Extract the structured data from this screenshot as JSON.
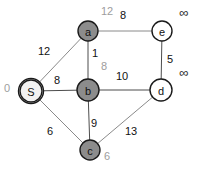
{
  "diagram": {
    "type": "weighted-undirected-graph",
    "title": "",
    "nodes": [
      {
        "id": "S",
        "label": "S",
        "cx": 31,
        "cy": 91,
        "r": 11,
        "fill": "#f2f2f2",
        "stroke": "#1a1a1a",
        "visited": false,
        "dist": "0",
        "dist_x": 7,
        "dist_y": 88,
        "dist_style": "gray"
      },
      {
        "id": "a",
        "label": "a",
        "cx": 88,
        "cy": 31,
        "r": 10,
        "fill": "#8c8c8c",
        "stroke": "#1a1a1a",
        "visited": true,
        "dist": "12",
        "dist_x": 107,
        "dist_y": 11,
        "dist_style": "gray"
      },
      {
        "id": "b",
        "label": "b",
        "cx": 88,
        "cy": 90,
        "r": 11,
        "fill": "#8c8c8c",
        "stroke": "#1a1a1a",
        "visited": true,
        "dist": "8",
        "dist_x": 104,
        "dist_y": 66,
        "dist_style": "gray"
      },
      {
        "id": "c",
        "label": "c",
        "cx": 90,
        "cy": 150,
        "r": 10,
        "fill": "#8c8c8c",
        "stroke": "#1a1a1a",
        "visited": true,
        "dist": "6",
        "dist_x": 107,
        "dist_y": 156,
        "dist_style": "gray"
      },
      {
        "id": "d",
        "label": "d",
        "cx": 161,
        "cy": 90,
        "r": 11,
        "fill": "#ffffff",
        "stroke": "#1a1a1a",
        "visited": false,
        "dist": "∞",
        "dist_x": 184,
        "dist_y": 72,
        "dist_style": "inf"
      },
      {
        "id": "e",
        "label": "e",
        "cx": 162,
        "cy": 31,
        "r": 10,
        "fill": "#ffffff",
        "stroke": "#1a1a1a",
        "visited": false,
        "dist": "∞",
        "dist_x": 184,
        "dist_y": 12,
        "dist_style": "inf"
      }
    ],
    "edges": [
      {
        "from": "S",
        "to": "a",
        "weight": "12",
        "lx": 44,
        "ly": 51,
        "color": "#8a8a8a"
      },
      {
        "from": "S",
        "to": "b",
        "weight": "8",
        "lx": 57,
        "ly": 80,
        "color": "#4d4d4d"
      },
      {
        "from": "S",
        "to": "c",
        "weight": "6",
        "lx": 50,
        "ly": 131,
        "color": "#8a8a8a"
      },
      {
        "from": "a",
        "to": "b",
        "weight": "1",
        "lx": 95,
        "ly": 53,
        "color": "#4d4d4d"
      },
      {
        "from": "a",
        "to": "e",
        "weight": "8",
        "lx": 123,
        "ly": 15,
        "color": "#8a8a8a"
      },
      {
        "from": "b",
        "to": "c",
        "weight": "9",
        "lx": 94,
        "ly": 123,
        "color": "#4d4d4d"
      },
      {
        "from": "b",
        "to": "d",
        "weight": "10",
        "lx": 122,
        "ly": 76,
        "color": "#4d4d4d"
      },
      {
        "from": "c",
        "to": "d",
        "weight": "13",
        "lx": 131,
        "ly": 131,
        "color": "#8a8a8a"
      },
      {
        "from": "e",
        "to": "d",
        "weight": "5",
        "lx": 170,
        "ly": 59,
        "color": "#4d4d4d"
      }
    ],
    "colors": {
      "visited_fill": "#8c8c8c",
      "unvisited_fill": "#ffffff",
      "source_fill": "#f2f2f2",
      "node_stroke": "#1a1a1a",
      "edge_light": "#8a8a8a",
      "edge_dark": "#4d4d4d",
      "dist_text": "#9d9d9d",
      "weight_text": "#111111",
      "background": "#ffffff"
    }
  }
}
